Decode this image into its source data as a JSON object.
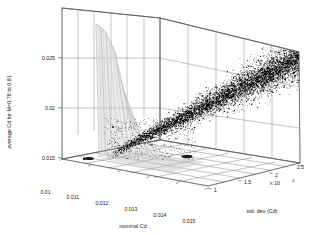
{
  "figure": {
    "type": "matlab-3d-scatter-figure",
    "background_color": "#ffffff"
  },
  "chart_data": {
    "type": "scatter",
    "title": "",
    "subtitle": "",
    "projection": "3d",
    "grid": true,
    "legend": null,
    "xlabel": "nominal Cd",
    "ylabel": "average Cd for M=0.78 to 0.81",
    "zlabel": "std. dev (Cd)",
    "x_ticks": [
      "0.01",
      "0.011",
      "0.012",
      "0.013",
      "0.014",
      "0.015"
    ],
    "x_tick_values": [
      0.01,
      0.011,
      0.012,
      0.013,
      0.014,
      0.015
    ],
    "y_ticks": [
      "0.015",
      "0.02",
      "0.025"
    ],
    "y_tick_values": [
      0.015,
      0.02,
      0.025
    ],
    "z_ticks": [
      "1",
      "1.5",
      "2",
      "2.5"
    ],
    "z_tick_values": [
      1,
      1.5,
      2,
      2.5
    ],
    "z_exponent_label": "x 10",
    "z_exponent_power": "-4",
    "xlim": [
      0.0095,
      0.0155
    ],
    "ylim": [
      0.0145,
      0.0262
    ],
    "zlim": [
      0.8,
      2.75
    ],
    "series": [
      {
        "name": "sample cloud",
        "marker": "dot",
        "color": "#000000",
        "description": "dense black point cloud forming an ascending band from lower-left to upper-right"
      },
      {
        "name": "density surface",
        "marker": "surface",
        "color": "#d9d9d9",
        "description": "tall narrow light-grey spike near nominal Cd = 0.0112"
      }
    ],
    "annotations": []
  },
  "axes": {
    "x_axis_name": "nominal-cd-axis",
    "y_axis_name": "average-cd-axis",
    "z_axis_name": "std-dev-cd-axis"
  }
}
